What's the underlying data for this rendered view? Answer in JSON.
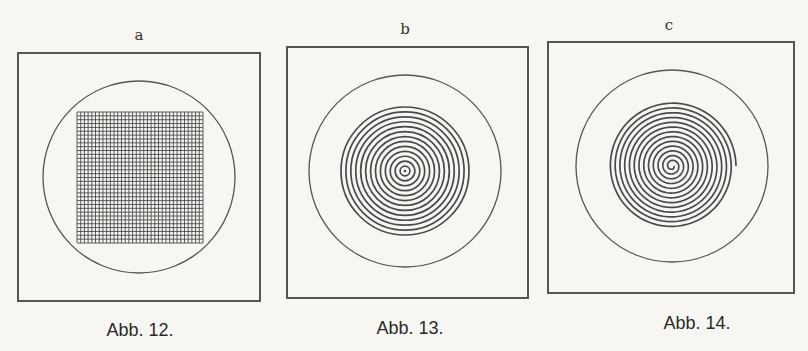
{
  "figures": [
    {
      "letter": "a",
      "caption": "Abb. 12.",
      "pattern": "square-grid",
      "grid_lines_per_side": 34
    },
    {
      "letter": "b",
      "caption": "Abb. 13.",
      "pattern": "concentric-circles",
      "ring_count": 13
    },
    {
      "letter": "c",
      "caption": "Abb. 14.",
      "pattern": "spiral",
      "ring_count": 13
    }
  ],
  "colors": {
    "ink": "#4a4a4a",
    "paper": "#f7f6f2"
  }
}
